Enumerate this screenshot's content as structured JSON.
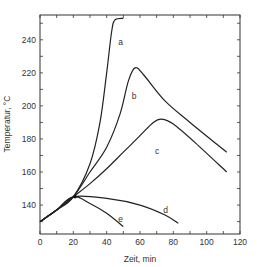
{
  "chart_data": {
    "type": "line",
    "title": "",
    "xlabel": "Zeit, min",
    "ylabel": "Temperatur, °C",
    "xlim": [
      0,
      120
    ],
    "ylim": [
      122.5,
      255
    ],
    "xticks": [
      0,
      20,
      40,
      60,
      80,
      100,
      120
    ],
    "yticks": [
      140,
      160,
      180,
      200,
      220,
      240
    ],
    "grid": false,
    "legend": "none (curves labeled inline a–e)",
    "series": [
      {
        "name": "a",
        "points": [
          [
            0,
            130
          ],
          [
            10,
            137
          ],
          [
            20,
            145
          ],
          [
            30,
            165
          ],
          [
            36,
            190
          ],
          [
            40,
            220
          ],
          [
            43,
            245
          ],
          [
            45,
            252
          ],
          [
            50,
            253
          ]
        ]
      },
      {
        "name": "b",
        "points": [
          [
            0,
            130
          ],
          [
            10,
            137
          ],
          [
            20,
            145
          ],
          [
            30,
            160
          ],
          [
            40,
            175
          ],
          [
            48,
            195
          ],
          [
            53,
            215
          ],
          [
            57,
            223
          ],
          [
            62,
            219
          ],
          [
            75,
            203
          ],
          [
            90,
            190
          ],
          [
            112,
            172
          ]
        ]
      },
      {
        "name": "c",
        "points": [
          [
            0,
            130
          ],
          [
            10,
            137
          ],
          [
            20,
            145
          ],
          [
            30,
            153
          ],
          [
            40,
            162
          ],
          [
            50,
            172
          ],
          [
            60,
            182
          ],
          [
            68,
            190
          ],
          [
            73,
            192
          ],
          [
            80,
            189
          ],
          [
            95,
            176
          ],
          [
            112,
            160
          ]
        ]
      },
      {
        "name": "d",
        "points": [
          [
            0,
            130
          ],
          [
            10,
            137
          ],
          [
            20,
            145
          ],
          [
            40,
            144
          ],
          [
            60,
            140
          ],
          [
            75,
            134
          ],
          [
            83,
            129
          ]
        ]
      },
      {
        "name": "e",
        "points": [
          [
            0,
            130
          ],
          [
            10,
            137
          ],
          [
            20,
            145
          ],
          [
            30,
            141
          ],
          [
            40,
            135
          ],
          [
            50,
            127
          ]
        ]
      }
    ],
    "annotations": [
      {
        "text": "a",
        "x": 47,
        "y": 237
      },
      {
        "text": "b",
        "x": 55,
        "y": 204
      },
      {
        "text": "c",
        "x": 69,
        "y": 171
      },
      {
        "text": "d",
        "x": 74,
        "y": 135
      },
      {
        "text": "e",
        "x": 47,
        "y": 130
      }
    ]
  },
  "axes": {
    "x_label": "Zeit, min",
    "y_label": "Temperatur, °C",
    "x_tick_labels": [
      "0",
      "20",
      "40",
      "60",
      "80",
      "100",
      "120"
    ],
    "y_tick_labels": [
      "140",
      "160",
      "180",
      "200",
      "220",
      "240"
    ]
  },
  "colors": {
    "line": "#222222",
    "axis": "#333333",
    "text": "#333333"
  }
}
